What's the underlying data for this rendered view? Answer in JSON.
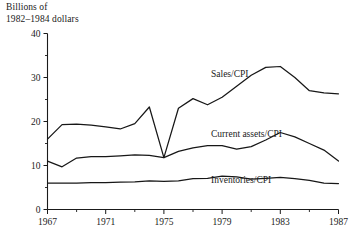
{
  "chart_data": {
    "type": "line",
    "title": "Billions of\n1982–1984 dollars",
    "ylabel": "Billions of 1982–1984 dollars",
    "xlabel": "",
    "xlim": [
      1967,
      1987
    ],
    "ylim": [
      0,
      40
    ],
    "grid": false,
    "legend_position": "inline-annotations",
    "ytick_labels": [
      "0",
      "10",
      "20",
      "30",
      "40"
    ],
    "ytick_values": [
      0,
      10,
      20,
      30,
      40
    ],
    "yminor_step": 5,
    "xtick_labels": [
      "1967",
      "1971",
      "1975",
      "1979",
      "1983",
      "1987"
    ],
    "xtick_values": [
      1967,
      1971,
      1975,
      1979,
      1983,
      1987
    ],
    "xminor_step": 2,
    "x": [
      1967,
      1968,
      1969,
      1970,
      1971,
      1972,
      1973,
      1974,
      1975,
      1976,
      1977,
      1978,
      1979,
      1980,
      1981,
      1982,
      1983,
      1984,
      1985,
      1986,
      1987
    ],
    "series": [
      {
        "name": "Sales/CPI",
        "label": "Sales/CPI",
        "color": "#171717",
        "values": [
          16.0,
          19.3,
          19.4,
          19.2,
          18.8,
          18.3,
          19.5,
          23.3,
          11.8,
          23.0,
          25.2,
          23.8,
          25.5,
          28.0,
          30.5,
          32.3,
          32.5,
          30.0,
          27.0,
          26.5,
          26.3
        ]
      },
      {
        "name": "Current assets/CPI",
        "label": "Current assets/CPI",
        "color": "#171717",
        "values": [
          11.0,
          9.7,
          11.7,
          12.0,
          12.0,
          12.2,
          12.4,
          12.3,
          11.8,
          13.2,
          14.0,
          14.5,
          14.5,
          13.7,
          14.3,
          15.8,
          17.5,
          16.5,
          15.0,
          13.5,
          11.0
        ]
      },
      {
        "name": "Inventories/CPI",
        "label": "Inventories/CPI",
        "color": "#171717",
        "values": [
          6.0,
          6.0,
          6.0,
          6.1,
          6.1,
          6.2,
          6.3,
          6.5,
          6.4,
          6.5,
          7.0,
          7.1,
          7.6,
          7.4,
          6.9,
          7.1,
          7.3,
          7.0,
          6.6,
          6.0,
          5.9
        ]
      }
    ],
    "annotations": [
      {
        "text": "Sales/CPI",
        "x_px": 211,
        "y_px": 77
      },
      {
        "text": "Current assets/CPI",
        "x_px": 211,
        "y_px": 137
      },
      {
        "text": "Inventories/CPI",
        "x_px": 211,
        "y_px": 183
      }
    ]
  }
}
